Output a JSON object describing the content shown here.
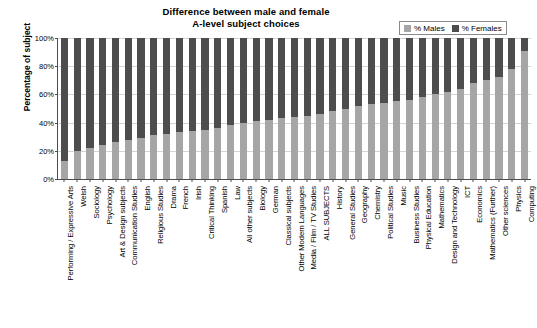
{
  "chart_data": {
    "type": "bar",
    "subtype": "stacked-bar-100-percent",
    "title": "Difference between male and female\nA-level subject choices",
    "title_line1": "Difference between male and female",
    "title_line2": "A-level subject choices",
    "xlabel": "",
    "ylabel": "Percentage of subject",
    "ylim": [
      0,
      100
    ],
    "ytick_labels": [
      "0%",
      "20%",
      "40%",
      "60%",
      "80%",
      "100%"
    ],
    "ytick_values": [
      0,
      20,
      40,
      60,
      80,
      100
    ],
    "grid": true,
    "grid_axis": "y",
    "legend_position": "top-right",
    "legend": [
      "% Males",
      "% Females"
    ],
    "colors": {
      "males": "#a6a6a6",
      "females": "#4d4d4d",
      "axis": "#4d4d4d",
      "grid": "#d4d4d4",
      "background": "#ffffff"
    },
    "categories": [
      "Performing / Expressive Arts",
      "Welsh",
      "Sociology",
      "Psychology",
      "Art & Design subjects",
      "Communication Studies",
      "English",
      "Religious Studies",
      "Drama",
      "French",
      "Irish",
      "Critical Thinking",
      "Spanish",
      "Law",
      "All other subjects",
      "Biology",
      "German",
      "Classical subjects",
      "Other Modern Languages",
      "Media / Film / TV Studies",
      "ALL SUBJECTS",
      "History",
      "General Studies",
      "Geography",
      "Chemistry",
      "Political Studies",
      "Music",
      "Business Studies",
      "Physical Education",
      "Mathematics",
      "Design and Technology",
      "ICT",
      "Economics",
      "Mathematics (Further)",
      "Other sciences",
      "Physics",
      "Computing"
    ],
    "series": [
      {
        "name": "% Males",
        "values": [
          13,
          20,
          22,
          24,
          26,
          28,
          29,
          31,
          32,
          33,
          34,
          35,
          36,
          38,
          40,
          41,
          42,
          43,
          44,
          45,
          46,
          48,
          50,
          52,
          53,
          54,
          55,
          56,
          58,
          60,
          62,
          64,
          68,
          70,
          72,
          78,
          91
        ]
      },
      {
        "name": "% Females",
        "values": [
          87,
          80,
          78,
          76,
          74,
          72,
          71,
          69,
          68,
          67,
          66,
          65,
          64,
          62,
          60,
          59,
          58,
          57,
          56,
          55,
          54,
          52,
          50,
          48,
          47,
          46,
          45,
          44,
          42,
          40,
          38,
          36,
          32,
          30,
          28,
          22,
          9
        ]
      }
    ]
  }
}
